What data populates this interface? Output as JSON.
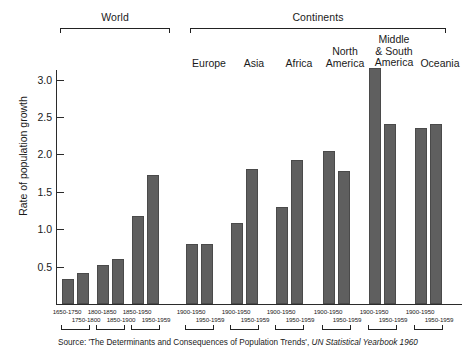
{
  "chart_data": {
    "type": "bar",
    "title": "",
    "xlabel": "",
    "ylabel": "Rate of population growth",
    "ylim": [
      0,
      3.35
    ],
    "yticks": [
      0.5,
      1.0,
      1.5,
      2.0,
      2.5,
      3.0
    ],
    "ytick_labels": [
      "0.5",
      "1.0",
      "1.5",
      "2.0",
      "2.5",
      "3.0"
    ],
    "grid": false,
    "legend": "none",
    "bar_color": "#5f5f5f",
    "axis_color": "#2b2b2b",
    "supergroups": [
      {
        "label": "World",
        "start_index": 0,
        "end_index": 5
      },
      {
        "label": "Continents",
        "start_index": 6,
        "end_index": 17
      }
    ],
    "groups": [
      {
        "name": "World",
        "periods": [
          "1650-1750",
          "1750-1800"
        ],
        "values": [
          0.33,
          0.42
        ]
      },
      {
        "name": "World",
        "periods": [
          "1800-1850",
          "1850-1900"
        ],
        "values": [
          0.52,
          0.6
        ]
      },
      {
        "name": "World",
        "periods": [
          "1850-1950",
          "1950-1959"
        ],
        "values": [
          1.17,
          1.72
        ]
      },
      {
        "name": "Europe",
        "periods": [
          "1900-1950",
          "1950-1959"
        ],
        "values": [
          0.8,
          0.8
        ]
      },
      {
        "name": "Asia",
        "periods": [
          "1900-1950",
          "1950-1959"
        ],
        "values": [
          1.08,
          1.8
        ]
      },
      {
        "name": "Africa",
        "periods": [
          "1900-1950",
          "1950-1959"
        ],
        "values": [
          1.3,
          1.92
        ]
      },
      {
        "name": "North America",
        "periods": [
          "1900-1950",
          "1950-1959"
        ],
        "values": [
          2.05,
          1.78
        ]
      },
      {
        "name": "Middle & South America",
        "periods": [
          "1900-1950",
          "1950-1959"
        ],
        "values": [
          3.15,
          2.4
        ]
      },
      {
        "name": "Oceania",
        "periods": [
          "1900-1950",
          "1950-1959"
        ],
        "values": [
          2.35,
          2.4
        ]
      }
    ],
    "continent_headers": [
      {
        "lines": [
          "Europe"
        ]
      },
      {
        "lines": [
          "Asia"
        ]
      },
      {
        "lines": [
          "Africa"
        ]
      },
      {
        "lines": [
          "North",
          "America"
        ]
      },
      {
        "lines": [
          "Middle",
          "& South",
          "America"
        ]
      },
      {
        "lines": [
          "Oceania"
        ]
      }
    ]
  },
  "source": {
    "prefix": "Source:",
    "quoted": "'The Determinants and Consequences of Population Trends',",
    "italic": "UN Statistical Yearbook 1960"
  }
}
